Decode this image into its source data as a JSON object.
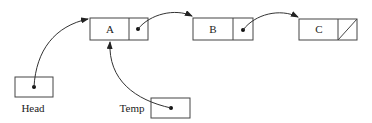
{
  "diagram": {
    "type": "linked-list",
    "nodes": [
      {
        "id": "A",
        "label": "A",
        "next": "B"
      },
      {
        "id": "B",
        "label": "B",
        "next": "C"
      },
      {
        "id": "C",
        "label": "C",
        "next": null
      }
    ],
    "pointers": [
      {
        "id": "head",
        "label": "Head",
        "points_to": "A"
      },
      {
        "id": "temp",
        "label": "Temp",
        "points_to": "A"
      }
    ]
  }
}
